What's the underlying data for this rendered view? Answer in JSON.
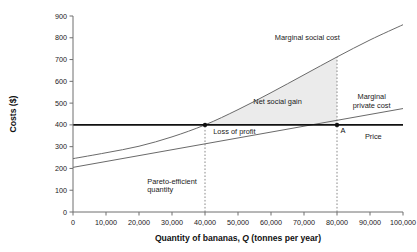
{
  "chart_data": {
    "type": "line",
    "title": "",
    "xlabel": "Quantity of bananas, Q (tonnes per year)",
    "ylabel": "Costs ($)",
    "xlabel_plain": "Quantity of bananas,",
    "xlabel_italic": "Q",
    "xlabel_tail": "(tonnes per year)",
    "xlim": [
      0,
      100000
    ],
    "ylim": [
      0,
      900
    ],
    "grid": false,
    "legend": "inline-annotations",
    "xticks": [
      0,
      10000,
      20000,
      30000,
      40000,
      50000,
      60000,
      70000,
      80000,
      90000,
      100000
    ],
    "xticklabels": [
      "0",
      "10,000",
      "20,000",
      "30,000",
      "40,000",
      "50,000",
      "60,000",
      "70,000",
      "80,000",
      "90,000",
      "100,000"
    ],
    "yticks": [
      0,
      100,
      200,
      300,
      400,
      500,
      600,
      700,
      800,
      900
    ],
    "yticklabels": [
      "0",
      "100",
      "200",
      "300",
      "400",
      "500",
      "600",
      "700",
      "800",
      "900"
    ],
    "series": [
      {
        "name": "Marginal social cost",
        "label": "Marginal social cost",
        "style": "curve",
        "color": "#6a6a6a",
        "x": [
          0,
          10000,
          20000,
          30000,
          40000,
          50000,
          60000,
          70000,
          80000,
          90000,
          100000
        ],
        "values": [
          245,
          272,
          302,
          345,
          400,
          470,
          548,
          630,
          712,
          790,
          860
        ]
      },
      {
        "name": "Marginal private cost",
        "label": "Marginal private cost",
        "style": "line",
        "color": "#6a6a6a",
        "x": [
          0,
          100000
        ],
        "values": [
          205,
          475
        ]
      },
      {
        "name": "Price",
        "label": "Price",
        "style": "bold-horizontal",
        "color": "#111111",
        "x": [
          0,
          100000
        ],
        "values": [
          400,
          400
        ]
      }
    ],
    "regions": [
      {
        "name": "Net social gain",
        "label": "Net social gain",
        "fill": "#ebebeb",
        "between": [
          "Marginal social cost",
          "Price"
        ],
        "x_range": [
          40000,
          80000
        ]
      }
    ],
    "markers": [
      {
        "name": "pareto-efficient-point",
        "x": 40000,
        "y": 400,
        "label": ""
      },
      {
        "name": "point-a",
        "x": 80000,
        "y": 400,
        "label": "A"
      }
    ],
    "guides": [
      {
        "name": "pareto-efficient-guide",
        "x": 40000,
        "from_y": 0,
        "to_y": 400
      },
      {
        "name": "market-quantity-guide",
        "x": 80000,
        "from_y": 0,
        "to_y": 712
      }
    ],
    "annotations": [
      {
        "name": "marginal-social-cost-label",
        "text": "Marginal social cost",
        "x": 71000,
        "y": 790,
        "anchor": "middle"
      },
      {
        "name": "marginal-private-cost-line1",
        "text": "Marginal",
        "x": 90500,
        "y": 520,
        "anchor": "middle"
      },
      {
        "name": "marginal-private-cost-line2",
        "text": "private cost",
        "x": 90500,
        "y": 477,
        "anchor": "middle"
      },
      {
        "name": "price-label",
        "text": "Price",
        "x": 91000,
        "y": 333,
        "anchor": "middle"
      },
      {
        "name": "net-social-gain-label",
        "text": "Net social gain",
        "x": 62000,
        "y": 497,
        "anchor": "middle"
      },
      {
        "name": "loss-of-profit-label",
        "text": "Loss of profit",
        "x": 42500,
        "y": 357,
        "anchor": "start"
      },
      {
        "name": "pareto-efficient-line1",
        "text": "Pareto-efficient",
        "x": 22500,
        "y": 128,
        "anchor": "start"
      },
      {
        "name": "pareto-efficient-line2",
        "text": "quantity",
        "x": 22500,
        "y": 92,
        "anchor": "start"
      }
    ]
  }
}
